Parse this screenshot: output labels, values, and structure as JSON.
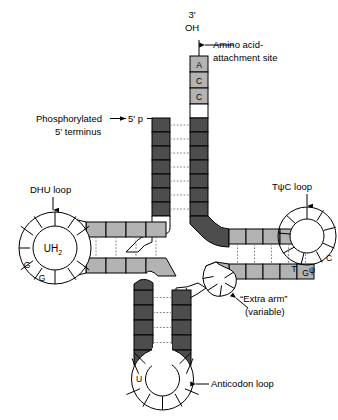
{
  "figure": {
    "type": "tRNA cloverleaf secondary structure diagram"
  },
  "labels": {
    "three_prime": "3'",
    "oh": "OH",
    "amino_acid_site_line1": "Amino acid-",
    "amino_acid_site_line2": "attachment site",
    "phosphorylated_line1": "Phosphorylated",
    "phosphorylated_line2": "5' terminus",
    "five_prime_p": "5' p",
    "dhu_loop": "DHU loop",
    "tpsic_loop": "TψC loop",
    "extra_arm_line1": "“Extra arm”",
    "extra_arm_line2": "(variable)",
    "anticodon_loop": "Anticodon loop",
    "uh2_center": "UH",
    "uh2_sub": "2"
  },
  "nucleotides": {
    "acceptor_3prime": [
      "A",
      "C",
      "C"
    ],
    "dhu_loop_marks": [
      "A",
      "G",
      "G"
    ],
    "tpsic_loop_marks": [
      "C",
      "G",
      "T",
      "ψ",
      "C"
    ],
    "acceptor_junction_u": "U",
    "anticodon_loop_u": "U"
  },
  "colors": {
    "stem_dark": "#4d4d4d",
    "stem_light": "#b3b3b3",
    "white": "#ffffff",
    "outline": "#000000",
    "pair_dash": "#808080"
  },
  "counts": {
    "acceptor_stem_pairs": 7,
    "dhu_stem_pairs": 4,
    "tpsic_stem_pairs": 5,
    "anticodon_stem_pairs": 5,
    "dhu_loop_segments": 10,
    "tpsic_loop_segments": 9,
    "anticodon_loop_segments": 7,
    "extra_arm_segments": 5
  }
}
